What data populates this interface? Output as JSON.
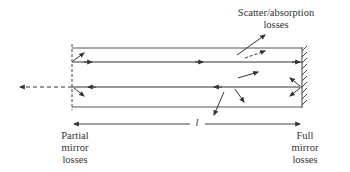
{
  "diagram": {
    "labels": {
      "scatter": {
        "line1": "Scatter/absorption",
        "line2": "losses"
      },
      "partial_mirror": {
        "line1": "Partial",
        "line2": "mirror",
        "line3": "losses"
      },
      "full_mirror": {
        "line1": "Full",
        "line2": "mirror",
        "line3": "losses"
      },
      "length": "l"
    },
    "elements": [
      "cavity-rectangle",
      "partial-mirror-dashed-left",
      "full-mirror-hatched-right",
      "forward-ray",
      "return-ray",
      "output-dashed-ray",
      "scatter-arrows",
      "length-dimension-arrow"
    ],
    "colors": {
      "stroke": "#333333",
      "background": "#ffffff"
    }
  }
}
